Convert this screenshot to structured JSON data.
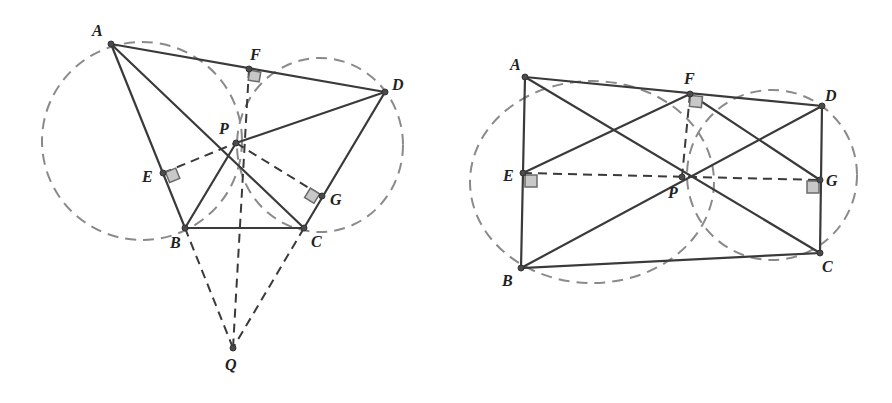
{
  "figures": [
    {
      "name": "left-figure",
      "labels": {
        "A": "A",
        "F": "F",
        "D": "D",
        "P": "P",
        "E": "E",
        "G": "G",
        "B": "B",
        "C": "C",
        "Q": "Q"
      }
    },
    {
      "name": "right-figure",
      "labels": {
        "A": "A",
        "F": "F",
        "D": "D",
        "E": "E",
        "P": "P",
        "G": "G",
        "B": "B",
        "C": "C"
      }
    }
  ]
}
